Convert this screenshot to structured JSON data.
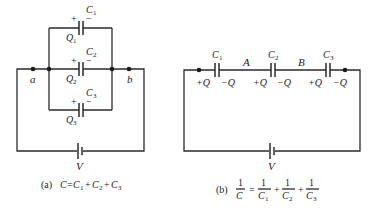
{
  "figure_a": {
    "capacitors": [
      {
        "name": "C",
        "sub": "1",
        "charge": "Q",
        "charge_sub": "1",
        "plus": "+",
        "minus": "−"
      },
      {
        "name": "C",
        "sub": "2",
        "charge": "Q",
        "charge_sub": "2",
        "plus": "+",
        "minus": "−"
      },
      {
        "name": "C",
        "sub": "3",
        "charge": "Q",
        "charge_sub": "3",
        "plus": "+",
        "minus": "−"
      }
    ],
    "node_a": "a",
    "node_b": "b",
    "battery": "V",
    "caption_tag": "(a)",
    "caption_eq": {
      "lhs": "C",
      "eq": "=",
      "t1": "C",
      "s1": "1",
      "plus1": "+",
      "t2": "C",
      "s2": "2",
      "plus2": "+",
      "t3": "C",
      "s3": "3"
    }
  },
  "figure_b": {
    "capacitors": [
      {
        "name": "C",
        "sub": "1",
        "left": "+Q",
        "right": "−Q"
      },
      {
        "name": "C",
        "sub": "2",
        "left": "+Q",
        "right": "−Q"
      },
      {
        "name": "C",
        "sub": "3",
        "left": "+Q",
        "right": "−Q"
      }
    ],
    "node_A": "A",
    "node_B": "B",
    "battery": "V",
    "caption_tag": "(b)",
    "caption_eq": {
      "one": "1",
      "lhs": "C",
      "eq": "=",
      "t1": "C",
      "s1": "1",
      "plus1": "+",
      "t2": "C",
      "s2": "2",
      "plus2": "+",
      "t3": "C",
      "s3": "3"
    }
  }
}
